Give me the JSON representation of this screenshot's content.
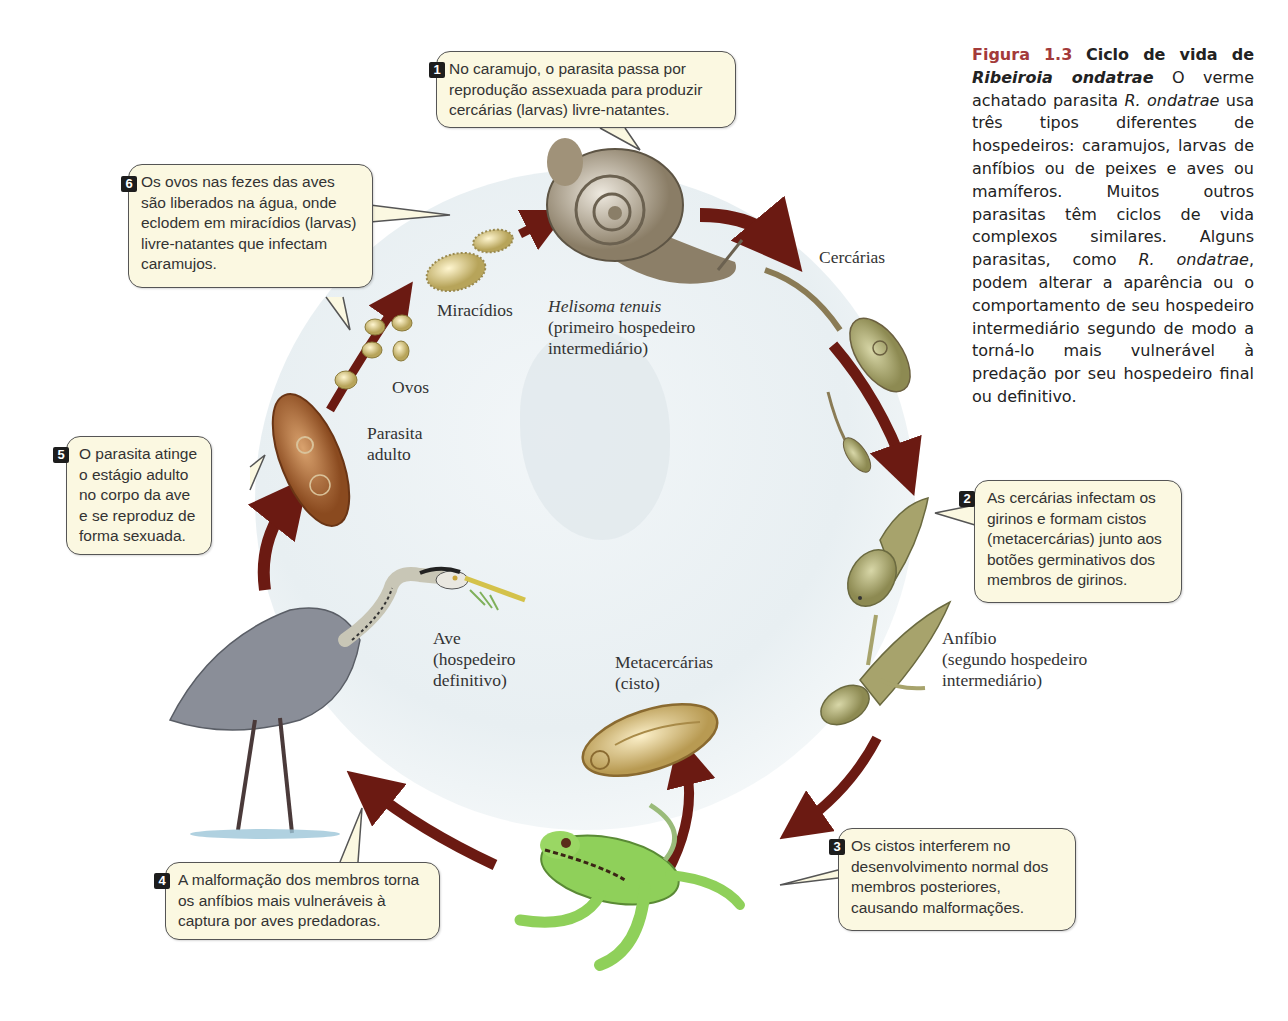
{
  "caption": {
    "figure_number": "Figura 1.3",
    "title": "Ciclo de vida de",
    "species_italic": "Ribeiroia ondatrae",
    "body_1": "O verme achatado parasita",
    "species_abbrev": "R. ondatrae",
    "body_2": "usa três tipos diferentes de hospedeiros: caramujos, larvas de anfíbios ou de peixes e aves ou mamíferos. Muitos outros parasitas têm ciclos de vida complexos similares. Alguns parasitas, como",
    "species_abbrev_2": "R. ondatrae",
    "body_3": ", podem alterar a aparência ou o comportamento de seu hospedeiro intermediário segundo de modo a torná-lo mais vulnerável à predação por seu hospedeiro final ou definitivo."
  },
  "callouts": [
    {
      "number": "1",
      "text": "No caramujo, o parasita passa por reprodução assexuada para produzir cercárias (larvas) livre-natantes."
    },
    {
      "number": "2",
      "text": "As cercárias infectam os girinos e formam cistos (metacercárias) junto aos botões germinativos dos membros de girinos."
    },
    {
      "number": "3",
      "text": "Os cistos interferem no desenvolvimento normal dos membros posteriores, causando malformações."
    },
    {
      "number": "4",
      "text": "A malformação dos membros torna os anfíbios mais vulneráveis à captura por aves predadoras."
    },
    {
      "number": "5",
      "text": "O parasita atinge o estágio adulto no corpo da ave e se reproduz de forma sexuada."
    },
    {
      "number": "6",
      "text": "Os ovos nas fezes das aves são liberados na água, onde eclodem em miracídios (larvas) livre-natantes que infectam caramujos."
    }
  ],
  "labels": {
    "snail_species": "Helisoma tenuis",
    "snail_role_1": "(primeiro hospedeiro",
    "snail_role_2": "intermediário)",
    "cercariae": "Cercárias",
    "miracidia": "Miracídios",
    "eggs": "Ovos",
    "adult_1": "Parasita",
    "adult_2": "adulto",
    "amphibian": "Anfíbio",
    "amphibian_role_1": "(segundo hospedeiro",
    "amphibian_role_2": "intermediário)",
    "bird": "Ave",
    "bird_role_1": "(hospedeiro",
    "bird_role_2": "definitivo)",
    "metacercariae": "Metacercárias",
    "cyst": "(cisto)"
  },
  "colors": {
    "arrow": "#6b1a12",
    "callout_bg": "#fbf8e1",
    "figure_label": "#a33a3a"
  }
}
